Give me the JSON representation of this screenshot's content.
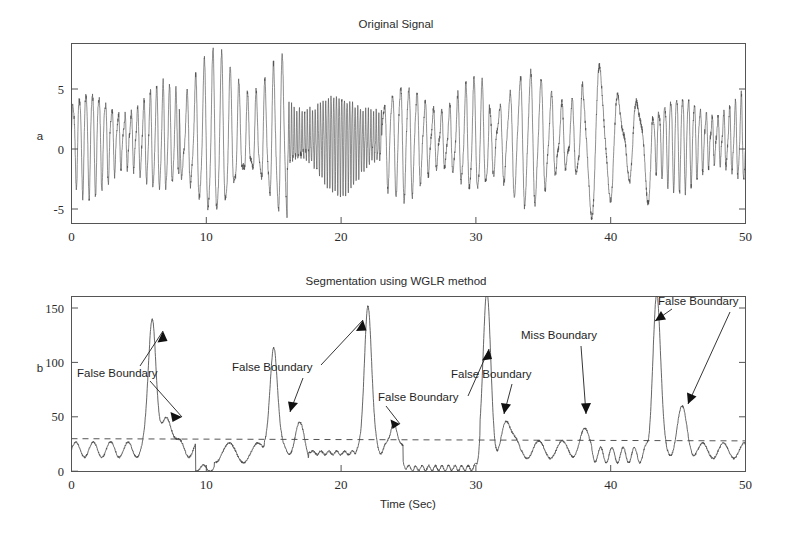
{
  "figure": {
    "width": 792,
    "height": 534,
    "background": "#ffffff",
    "line_color": "#4a4a4a",
    "axis_color": "#555555",
    "text_color": "#2b2b2b"
  },
  "panels": {
    "top": {
      "title": "Original Signal",
      "ylabel": "a",
      "xlabel": "",
      "xticks": [
        "0",
        "10",
        "20",
        "30",
        "40",
        "50"
      ],
      "yticks": [
        "5",
        "0",
        "-5"
      ]
    },
    "bottom": {
      "title": "Segmentation using WGLR method",
      "ylabel": "b",
      "xlabel": "Time (Sec)",
      "xticks": [
        "0",
        "10",
        "20",
        "30",
        "40",
        "50"
      ],
      "yticks": [
        "150",
        "100",
        "50",
        "0"
      ]
    }
  },
  "annotations": [
    {
      "id": "ann-1",
      "label": "False Boundary",
      "x": 77,
      "y": 377
    },
    {
      "id": "ann-2",
      "label": "False Boundary",
      "x": 232,
      "y": 371
    },
    {
      "id": "ann-3",
      "label": "False Boundary",
      "x": 378,
      "y": 401
    },
    {
      "id": "ann-4",
      "label": "False Boundary",
      "x": 451,
      "y": 378
    },
    {
      "id": "ann-5",
      "label": "Miss Boundary",
      "x": 521,
      "y": 339
    },
    {
      "id": "ann-6",
      "label": "False Boundary",
      "x": 658,
      "y": 305
    }
  ],
  "chart_data": [
    {
      "type": "line",
      "id": "original-signal",
      "title": "Original Signal",
      "xlabel": "",
      "ylabel": "a",
      "xlim": [
        0,
        50
      ],
      "ylim": [
        -7,
        8
      ],
      "xticks": [
        0,
        10,
        20,
        30,
        40,
        50
      ],
      "yticks": [
        5,
        0,
        -5
      ],
      "grid": false,
      "legend": "none",
      "description": "Oscillatory multi-segment time series with abrupt changes in amplitude and frequency at approximately t = 8, 16, 23, 31, 38 and 43 seconds.",
      "segments": [
        {
          "t_start": 0,
          "t_end": 8,
          "amplitude": 4.3,
          "frequency_hz": 2.1
        },
        {
          "t_start": 8,
          "t_end": 16,
          "amplitude": 6.6,
          "frequency_hz": 1.55
        },
        {
          "t_start": 16,
          "t_end": 23,
          "amplitude": 4.0,
          "frequency_hz": 5.1
        },
        {
          "t_start": 23,
          "t_end": 31,
          "amplitude": 4.6,
          "frequency_hz": 1.65
        },
        {
          "t_start": 31,
          "t_end": 38,
          "amplitude": 5.4,
          "frequency_hz": 1.3
        },
        {
          "t_start": 38,
          "t_end": 43,
          "amplitude": 6.2,
          "frequency_hz": 0.72
        },
        {
          "t_start": 43,
          "t_end": 50,
          "amplitude": 3.9,
          "frequency_hz": 2.3
        }
      ]
    },
    {
      "type": "line",
      "id": "wglr-detection",
      "title": "Segmentation using WGLR method",
      "xlabel": "Time (Sec)",
      "ylabel": "b",
      "xlim": [
        0,
        50
      ],
      "ylim": [
        0,
        160
      ],
      "xticks": [
        0,
        10,
        20,
        30,
        40,
        50
      ],
      "yticks": [
        0,
        50,
        100,
        150
      ],
      "grid": false,
      "legend": "none",
      "threshold": 30,
      "threshold_style": "dashed",
      "description": "WGLR test statistic versus time. Peaks crossing the dashed threshold of 30 are declared boundaries; extra crossings are labelled False Boundary and an undetected change near t = 38 is labelled Miss Boundary.",
      "peaks": [
        {
          "t": 6.0,
          "value": 141,
          "kind": "true-boundary"
        },
        {
          "t": 7.2,
          "value": 46,
          "kind": "false-boundary"
        },
        {
          "t": 15.0,
          "value": 123,
          "kind": "true-boundary"
        },
        {
          "t": 16.8,
          "value": 43,
          "kind": "false-boundary"
        },
        {
          "t": 22.0,
          "value": 148,
          "kind": "true-boundary"
        },
        {
          "t": 23.9,
          "value": 41,
          "kind": "false-boundary"
        },
        {
          "t": 30.8,
          "value": 160,
          "kind": "true-boundary"
        },
        {
          "t": 32.4,
          "value": 45,
          "kind": "false-boundary"
        },
        {
          "t": 38.0,
          "value": 28,
          "kind": "miss-boundary"
        },
        {
          "t": 43.4,
          "value": 158,
          "kind": "true-boundary"
        },
        {
          "t": 45.3,
          "value": 50,
          "kind": "false-boundary"
        }
      ],
      "baseline_level": 18
    }
  ]
}
